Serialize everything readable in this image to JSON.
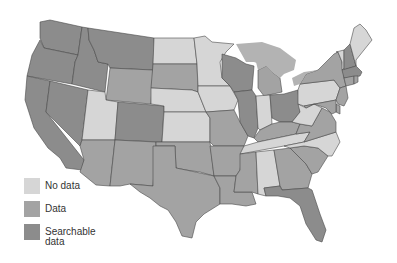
{
  "map": {
    "title": "",
    "colors": {
      "no_data": "#d6d6d6",
      "data": "#a3a3a3",
      "searchable": "#8c8c8c",
      "lakes": "#b3b3b3",
      "border": "#4a4a4a"
    },
    "states": {
      "WA": "searchable",
      "OR": "searchable",
      "CA": "searchable",
      "NV": "searchable",
      "ID": "searchable",
      "MT": "searchable",
      "WY": "data",
      "UT": "no_data",
      "AZ": "data",
      "CO": "searchable",
      "NM": "data",
      "ND": "no_data",
      "SD": "data",
      "NE": "no_data",
      "KS": "no_data",
      "OK": "data",
      "TX": "data",
      "MN": "no_data",
      "IA": "no_data",
      "MO": "data",
      "AR": "data",
      "LA": "data",
      "WI": "searchable",
      "IL": "searchable",
      "MI": "data",
      "IN": "no_data",
      "OH": "searchable",
      "KY": "data",
      "TN": "no_data",
      "MS": "data",
      "AL": "no_data",
      "GA": "data",
      "FL": "searchable",
      "SC": "data",
      "NC": "no_data",
      "VA": "data",
      "WV": "no_data",
      "PA": "no_data",
      "NY": "data",
      "VT": "no_data",
      "NH": "searchable",
      "ME": "no_data",
      "MA": "searchable",
      "CT": "data",
      "RI": "data",
      "NJ": "data",
      "DE": "data",
      "MD": "data"
    }
  },
  "legend": {
    "items": [
      {
        "label": "No data",
        "color": "#d6d6d6"
      },
      {
        "label": "Data",
        "color": "#a3a3a3"
      },
      {
        "label": "Searchable data",
        "color": "#8c8c8c"
      }
    ]
  }
}
